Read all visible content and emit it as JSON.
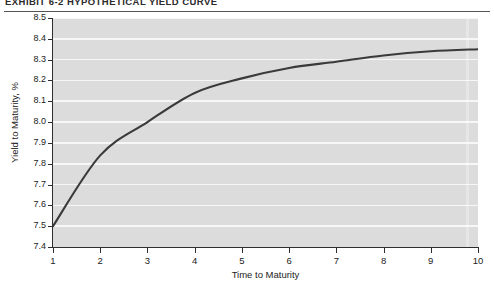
{
  "exhibit": {
    "title": "EXHIBIT 6-2  HYPOTHETICAL YIELD CURVE"
  },
  "colors": {
    "plot_background": "#dcdcdc",
    "gridline": "#f7f7f7",
    "curve": "#3a3a3a",
    "axis": "#2e2e2e",
    "text": "#222222"
  },
  "chart_data": {
    "type": "line",
    "title": "EXHIBIT 6-2  HYPOTHETICAL YIELD CURVE",
    "xlabel": "Time to Maturity",
    "ylabel": "Yield to Maturity, %",
    "x": [
      1,
      2,
      3,
      4,
      5,
      6,
      7,
      8,
      9,
      10
    ],
    "values": [
      7.5,
      7.84,
      8.0,
      8.14,
      8.21,
      8.26,
      8.29,
      8.32,
      8.34,
      8.35
    ],
    "xlim": [
      1,
      10
    ],
    "ylim": [
      7.4,
      8.5
    ],
    "xticks": [
      "1",
      "2",
      "3",
      "4",
      "5",
      "6",
      "7",
      "8",
      "9",
      "10"
    ],
    "yticks": [
      "7.4",
      "7.5",
      "7.6",
      "7.7",
      "7.8",
      "7.9",
      "8.0",
      "8.1",
      "8.2",
      "8.3",
      "8.4",
      "8.5"
    ],
    "grid": "horizontal",
    "legend": "none",
    "series_name": "Yield curve"
  }
}
